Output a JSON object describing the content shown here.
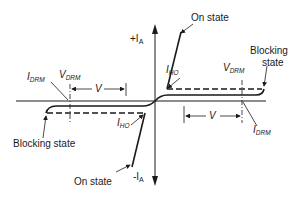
{
  "diagram": {
    "type": "thyristor bidirectional I-V characteristic",
    "axes": {
      "y_positive_label": "+I",
      "y_positive_sub": "A",
      "y_negative_label": "-I",
      "y_negative_sub": "A"
    },
    "labels": {
      "on_state_upper": "On state",
      "on_state_lower": "On state",
      "blocking_upper_line1": "Blocking",
      "blocking_upper_line2": "state",
      "blocking_lower": "Blocking state",
      "i_ho_upper": "I",
      "i_ho_upper_sub": "HO",
      "i_ho_lower": "I",
      "i_ho_lower_sub": "HO",
      "v_drm_left": "V",
      "v_drm_left_sub": "DRM",
      "v_drm_right": "V",
      "v_drm_right_sub": "DRM",
      "i_drm_left": "I",
      "i_drm_left_sub": "DRM",
      "i_drm_right": "I",
      "i_drm_right_sub": "DRM",
      "v_left": "V",
      "v_right": "V"
    },
    "colors": {
      "line": "#1a1a1a",
      "background": "#ffffff"
    }
  }
}
